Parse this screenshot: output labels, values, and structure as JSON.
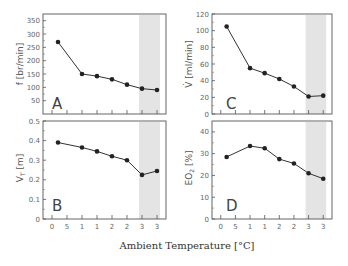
{
  "chart_data": [
    {
      "type": "line",
      "panel": "A",
      "ylabel": "f [br/min]",
      "ylim": [
        0,
        375
      ],
      "yticks": [
        50,
        100,
        150,
        200,
        250,
        300,
        350
      ],
      "x": [
        2,
        10,
        15,
        20,
        25,
        30,
        35
      ],
      "values": [
        270,
        150,
        142,
        130,
        110,
        95,
        90
      ]
    },
    {
      "type": "line",
      "panel": "B",
      "ylabel": "V_T [m]",
      "ylim": [
        0,
        0.5
      ],
      "yticks": [
        0,
        0.1,
        0.2,
        0.3,
        0.4,
        0.5
      ],
      "x": [
        2,
        10,
        15,
        20,
        25,
        30,
        35
      ],
      "values": [
        0.39,
        0.365,
        0.345,
        0.32,
        0.3,
        0.225,
        0.245
      ]
    },
    {
      "type": "line",
      "panel": "C",
      "ylabel": "V̇ [ml/min]",
      "ylim": [
        0,
        120
      ],
      "yticks": [
        0,
        20,
        40,
        60,
        80,
        100,
        120
      ],
      "x": [
        2,
        10,
        15,
        20,
        25,
        30,
        35
      ],
      "values": [
        105,
        55,
        49,
        42,
        33,
        21,
        22
      ]
    },
    {
      "type": "line",
      "panel": "D",
      "ylabel": "EO2 [%]",
      "ylim": [
        0,
        45
      ],
      "yticks": [
        0,
        10,
        20,
        30,
        40
      ],
      "x": [
        2,
        10,
        15,
        20,
        25,
        30,
        35
      ],
      "values": [
        28.5,
        33.5,
        32.5,
        27.5,
        25.5,
        21,
        18.5
      ]
    }
  ],
  "shared": {
    "xlabel": "Ambient Temperature [°C]",
    "xtick_values": [
      0,
      5,
      10,
      15,
      20,
      25,
      30,
      35
    ],
    "xtick_labels": [
      "0",
      "5",
      "1",
      "1",
      "2",
      "2",
      "3",
      "3"
    ],
    "shaded_band": [
      30,
      35
    ],
    "shade_color": "#e4e4e4",
    "line_color": "#333333"
  },
  "labels": {
    "a": "A",
    "b": "B",
    "c": "C",
    "d": "D",
    "ylabel_a": "f [br/min]",
    "ylabel_b_main": "V",
    "ylabel_b_sub": "T",
    "ylabel_b_rest": " [m]",
    "ylabel_c": "V̇ [ml/min]",
    "ylabel_d_main": "EO",
    "ylabel_d_sub": "2",
    "ylabel_d_rest": " [%]",
    "xlabel": "Ambient Temperature [°C]"
  }
}
